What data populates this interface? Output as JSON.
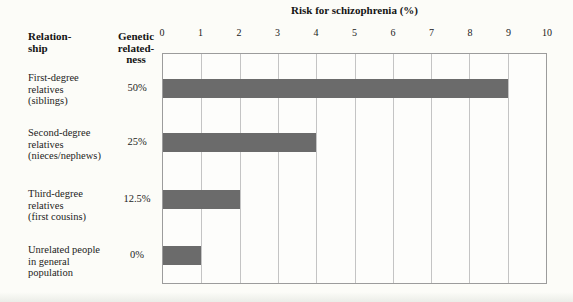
{
  "chart_data": {
    "type": "bar",
    "orientation": "horizontal",
    "title": "Risk for schizophrenia (%)",
    "categories": [
      "First-degree relatives (siblings)",
      "Second-degree relatives (nieces/nephews)",
      "Third-degree relatives (first cousins)",
      "Unrelated people in general population"
    ],
    "values": [
      9,
      4,
      2,
      1
    ],
    "xlabel": "Risk for schizophrenia (%)",
    "ylabel": "Relationship",
    "xlim": [
      0,
      10
    ],
    "xticks": [
      0,
      1,
      2,
      3,
      4,
      5,
      6,
      7,
      8,
      9,
      10
    ],
    "grid": true,
    "legend": false,
    "bar_color": "#6b6b6b",
    "gridline_color": "#c4c4c4"
  },
  "table": {
    "col1_header_lines": [
      "Relation-",
      "ship"
    ],
    "col2_header_lines": [
      "Genetic",
      "related-",
      "ness"
    ],
    "rows": [
      {
        "relationship_lines": [
          "First-degree",
          "relatives",
          "(siblings)"
        ],
        "relatedness": "50%",
        "risk_percent": 9
      },
      {
        "relationship_lines": [
          "Second-degree",
          "relatives",
          "(nieces/nephews)"
        ],
        "relatedness": "25%",
        "risk_percent": 4
      },
      {
        "relationship_lines": [
          "Third-degree",
          "relatives",
          "(first cousins)"
        ],
        "relatedness": "12.5%",
        "risk_percent": 2
      },
      {
        "relationship_lines": [
          "Unrelated people",
          "in general",
          "population"
        ],
        "relatedness": "0%",
        "risk_percent": 1
      }
    ]
  }
}
